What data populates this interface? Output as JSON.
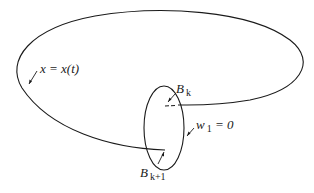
{
  "diagram": {
    "stroke_color": "#1a1a1a",
    "background": "#ffffff",
    "labels": {
      "trajectory": {
        "text": "x = x(t)"
      },
      "b_k": {
        "base": "B",
        "sub": "k"
      },
      "b_k1": {
        "base": "B",
        "sub": "k+1"
      },
      "w1": {
        "base": "w",
        "sub": "1",
        "rest": " = 0"
      }
    },
    "elements": [
      "closed trajectory curve x = x(t)",
      "small ellipse (surface w1 = 0)",
      "intersection point Bk",
      "intersection point Bk+1"
    ]
  }
}
